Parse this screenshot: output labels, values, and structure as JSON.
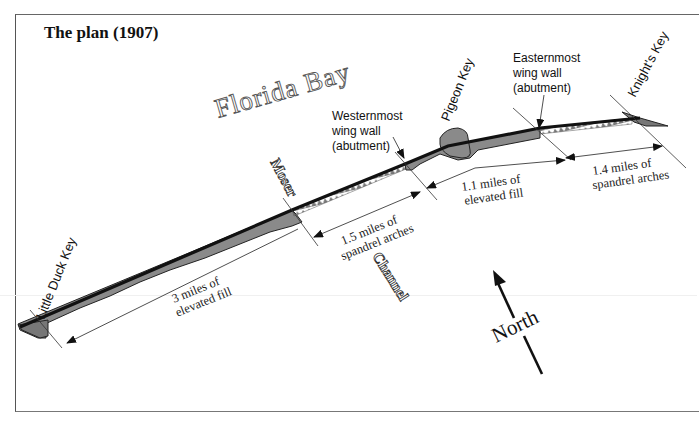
{
  "title": "The plan (1907)",
  "water_labels": {
    "bay": "Florida Bay",
    "channel": "Channel"
  },
  "keys": {
    "little_duck": "Little Duck Key",
    "moser": "Moser",
    "pigeon": "Pigeon Key",
    "knights": "Knight's Key"
  },
  "annotations": {
    "west_wall": [
      "Westernmost",
      "wing wall",
      "(abutment)"
    ],
    "east_wall": [
      "Easternmost",
      "wing wall",
      "(abutment)"
    ]
  },
  "segments": [
    {
      "id": "fill-3mi",
      "lines": [
        "3 miles of",
        "elevated fill"
      ]
    },
    {
      "id": "arches-1-5mi",
      "lines": [
        "1.5 miles of",
        "spandrel arches"
      ]
    },
    {
      "id": "fill-1-1mi",
      "lines": [
        "1.1 miles of",
        "elevated fill"
      ]
    },
    {
      "id": "arches-1-4mi",
      "lines": [
        "1.4 miles of",
        "spandrel arches"
      ]
    }
  ],
  "compass": {
    "label": "North"
  },
  "colors": {
    "fill_gray": "#8a8a8a",
    "deck": "#111111",
    "line": "#222222",
    "arch": "#777777"
  }
}
